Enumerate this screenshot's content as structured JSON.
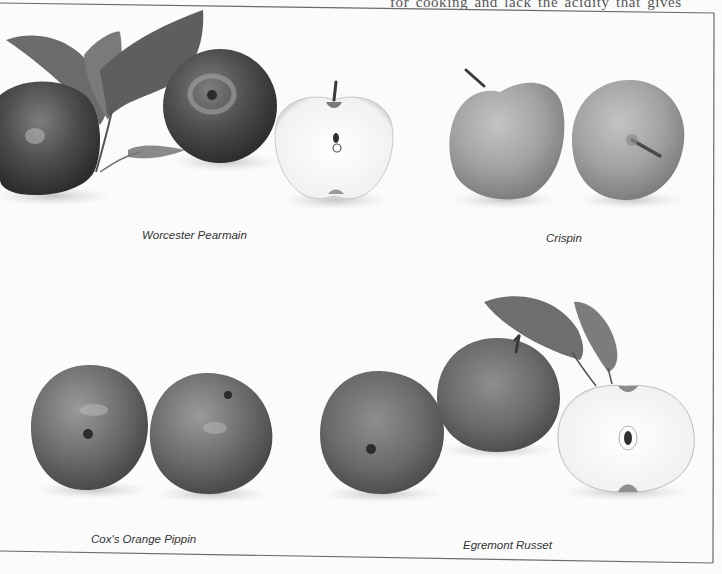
{
  "page": {
    "running_text_fragment": "ld as wines",
    "running_text_fragment_right": "for cooking and lack the acidity that gives"
  },
  "plate": {
    "varieties": [
      {
        "id": "worcester",
        "caption": "Worcester Pearmain",
        "items": [
          "whole apple with leaves",
          "whole apple",
          "halved apple"
        ]
      },
      {
        "id": "crispin",
        "caption": "Crispin",
        "items": [
          "whole apple side view",
          "whole apple top view"
        ]
      },
      {
        "id": "cox",
        "caption": "Cox's Orange Pippin",
        "items": [
          "whole apple calyx view",
          "whole apple"
        ]
      },
      {
        "id": "egremont",
        "caption": "Egremont Russet",
        "items": [
          "whole apple calyx view",
          "whole apple with leaves",
          "halved apple"
        ]
      }
    ]
  },
  "colors": {
    "background": "#fbfbfb",
    "frame_line": "#6a6a6a",
    "caption_text": "#333333",
    "apple_dark": "#3e3e3e",
    "apple_mid": "#7a7a7a",
    "apple_light": "#a8a8a8",
    "flesh": "#f6f6f6"
  }
}
